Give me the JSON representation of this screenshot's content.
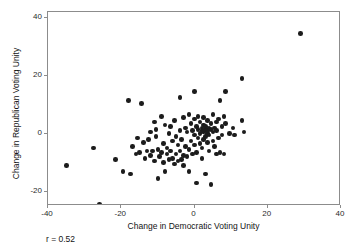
{
  "chart_data": {
    "type": "scatter",
    "title": "",
    "xlabel": "Change in Democratic Voting Unity",
    "ylabel": "Change in Republican Voting Unity",
    "xlim": [
      -40,
      40
    ],
    "ylim": [
      -25,
      42
    ],
    "xticks": [
      -40,
      -20,
      0,
      20,
      40
    ],
    "yticks": [
      -20,
      0,
      20,
      40
    ],
    "xticklabels": [
      "-40",
      "-20",
      "0",
      "20",
      "40"
    ],
    "yticklabels": [
      "-20",
      "0",
      "20",
      "40"
    ],
    "grid": false,
    "legend": null,
    "marker": "filled-circle",
    "marker_color": "#1c1c1c",
    "annotations": [
      {
        "name": "correlation",
        "text": "r = 0.52",
        "value": 0.52
      }
    ],
    "n_points": 120,
    "points": [
      [
        -35.0,
        -11.0
      ],
      [
        -27.5,
        -5.0
      ],
      [
        -26.0,
        -24.5
      ],
      [
        -21.5,
        -9.0
      ],
      [
        -19.5,
        -13.0
      ],
      [
        -18.0,
        11.5
      ],
      [
        -17.5,
        -14.0
      ],
      [
        -17.0,
        -4.5
      ],
      [
        -16.0,
        -7.0
      ],
      [
        -15.5,
        -1.5
      ],
      [
        -15.0,
        -6.5
      ],
      [
        -14.5,
        10.5
      ],
      [
        -14.0,
        -3.0
      ],
      [
        -13.5,
        -8.5
      ],
      [
        -13.0,
        -6.0
      ],
      [
        -12.5,
        -2.0
      ],
      [
        -12.0,
        -7.5
      ],
      [
        -12.0,
        0.5
      ],
      [
        -11.5,
        -6.0
      ],
      [
        -11.0,
        -9.5
      ],
      [
        -11.0,
        4.0
      ],
      [
        -10.5,
        -1.0
      ],
      [
        -10.5,
        1.5
      ],
      [
        -10.0,
        -15.5
      ],
      [
        -10.0,
        -5.5
      ],
      [
        -9.5,
        -8.0
      ],
      [
        -9.0,
        6.0
      ],
      [
        -9.0,
        -6.5
      ],
      [
        -8.5,
        -10.0
      ],
      [
        -8.5,
        -3.5
      ],
      [
        -8.0,
        -13.0
      ],
      [
        -8.0,
        3.0
      ],
      [
        -7.5,
        -7.0
      ],
      [
        -7.5,
        -5.0
      ],
      [
        -7.0,
        0.0
      ],
      [
        -7.0,
        -9.0
      ],
      [
        -6.5,
        -6.0
      ],
      [
        -6.5,
        2.5
      ],
      [
        -6.0,
        -8.5
      ],
      [
        -6.0,
        -2.5
      ],
      [
        -5.5,
        -10.5
      ],
      [
        -5.5,
        4.5
      ],
      [
        -5.0,
        -7.0
      ],
      [
        -5.0,
        -1.0
      ],
      [
        -4.5,
        -9.5
      ],
      [
        -4.5,
        -4.0
      ],
      [
        -4.0,
        12.5
      ],
      [
        -4.0,
        -6.0
      ],
      [
        -4.0,
        1.0
      ],
      [
        -3.5,
        -9.0
      ],
      [
        -3.5,
        -2.0
      ],
      [
        -3.0,
        5.5
      ],
      [
        -3.0,
        -7.5
      ],
      [
        -3.0,
        -11.0
      ],
      [
        -2.5,
        -4.5
      ],
      [
        -2.5,
        2.0
      ],
      [
        -2.0,
        -8.0
      ],
      [
        -2.0,
        0.5
      ],
      [
        -1.5,
        -5.5
      ],
      [
        -1.5,
        6.5
      ],
      [
        -1.5,
        -13.0
      ],
      [
        -1.0,
        -2.5
      ],
      [
        -1.0,
        3.5
      ],
      [
        -0.5,
        -7.0
      ],
      [
        -0.5,
        1.0
      ],
      [
        0.0,
        14.5
      ],
      [
        0.0,
        -4.0
      ],
      [
        0.0,
        5.0
      ],
      [
        0.0,
        -0.5
      ],
      [
        0.5,
        -17.0
      ],
      [
        0.5,
        2.5
      ],
      [
        0.5,
        -6.5
      ],
      [
        1.0,
        6.0
      ],
      [
        1.0,
        -1.5
      ],
      [
        1.0,
        1.5
      ],
      [
        1.5,
        -3.5
      ],
      [
        1.5,
        4.0
      ],
      [
        1.5,
        0.0
      ],
      [
        2.0,
        2.0
      ],
      [
        2.0,
        -5.0
      ],
      [
        2.0,
        1.0
      ],
      [
        2.0,
        -8.5
      ],
      [
        2.5,
        3.0
      ],
      [
        2.5,
        0.5
      ],
      [
        2.5,
        -2.0
      ],
      [
        2.5,
        5.5
      ],
      [
        3.0,
        1.5
      ],
      [
        3.0,
        -1.0
      ],
      [
        3.0,
        -14.0
      ],
      [
        3.0,
        2.5
      ],
      [
        3.5,
        0.0
      ],
      [
        3.5,
        -3.0
      ],
      [
        3.5,
        4.5
      ],
      [
        3.5,
        1.0
      ],
      [
        4.0,
        2.0
      ],
      [
        4.0,
        -6.0
      ],
      [
        4.0,
        -0.5
      ],
      [
        4.5,
        3.5
      ],
      [
        4.5,
        1.5
      ],
      [
        4.5,
        -17.5
      ],
      [
        5.0,
        6.5
      ],
      [
        5.0,
        -2.5
      ],
      [
        5.0,
        0.5
      ],
      [
        5.5,
        2.0
      ],
      [
        5.5,
        -4.5
      ],
      [
        6.0,
        4.0
      ],
      [
        6.0,
        -7.0
      ],
      [
        6.0,
        1.0
      ],
      [
        6.5,
        -1.5
      ],
      [
        6.5,
        5.0
      ],
      [
        7.0,
        11.5
      ],
      [
        7.0,
        -6.5
      ],
      [
        7.5,
        2.5
      ],
      [
        7.5,
        -0.5
      ],
      [
        8.0,
        6.0
      ],
      [
        8.0,
        -7.0
      ],
      [
        8.5,
        14.5
      ],
      [
        8.5,
        3.5
      ],
      [
        9.5,
        0.0
      ],
      [
        10.5,
        2.0
      ],
      [
        11.0,
        -0.5
      ],
      [
        13.0,
        19.0
      ],
      [
        13.0,
        4.5
      ],
      [
        13.5,
        0.5
      ],
      [
        29.0,
        34.5
      ]
    ]
  }
}
